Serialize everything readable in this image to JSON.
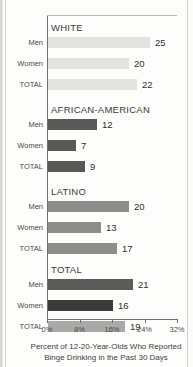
{
  "chart_data": {
    "type": "bar",
    "orientation": "horizontal",
    "title": "",
    "xlabel": "Percent of 12-20-Year-Olds Who Reported Binge Drinking in the Past 30 Days",
    "ylabel": "",
    "xlim": [
      0,
      32
    ],
    "xticks": [
      0,
      8,
      16,
      24,
      32
    ],
    "xtick_labels": [
      "0%",
      "8%",
      "16%",
      "24%",
      "32%"
    ],
    "grid": false,
    "legend": "none",
    "groups": [
      {
        "name": "WHITE",
        "color": "#e3e3e1",
        "categories": [
          "Men",
          "Women",
          "TOTAL"
        ],
        "values": [
          25,
          20,
          22
        ]
      },
      {
        "name": "AFRICAN-AMERICAN",
        "color": "#585856",
        "categories": [
          "Men",
          "Women",
          "TOTAL"
        ],
        "values": [
          12,
          7,
          9
        ]
      },
      {
        "name": "LATINO",
        "color": "#8d8d8b",
        "categories": [
          "Men",
          "Women",
          "TOTAL"
        ],
        "values": [
          20,
          13,
          17
        ]
      },
      {
        "name": "TOTAL",
        "color": "#6a6a68",
        "categories": [
          "Men",
          "Women",
          "TOTAL"
        ],
        "values": [
          21,
          16,
          19
        ],
        "bar_colors": [
          "#5b5b59",
          "#3a3a38",
          "#a9a9a7"
        ]
      }
    ],
    "caption_lines": [
      "Percent of 12-20-Year-Olds Who Reported",
      "Binge Drinking in the Past 30 Days"
    ]
  }
}
